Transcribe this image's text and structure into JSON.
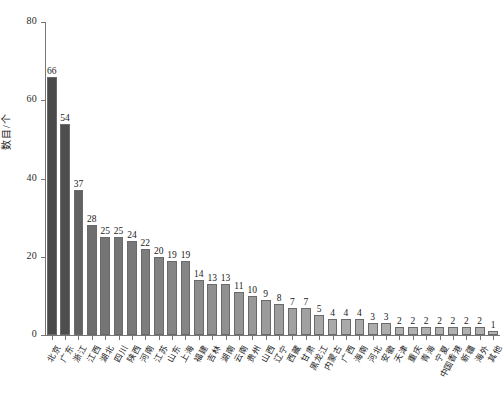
{
  "chart_data": {
    "type": "bar",
    "title": "",
    "xlabel": "",
    "ylabel": "数目/个",
    "ylim": [
      0,
      80
    ],
    "yticks": [
      0,
      20,
      40,
      60,
      80
    ],
    "grid": false,
    "legend": "none",
    "categories": [
      "北京",
      "广东",
      "浙江",
      "江西",
      "湖北",
      "四川",
      "陕西",
      "河南",
      "江苏",
      "山东",
      "上海",
      "福建",
      "吉林",
      "湖南",
      "云南",
      "贵州",
      "山西",
      "辽宁",
      "西藏",
      "甘肃",
      "黑龙江",
      "内蒙古",
      "广西",
      "海南",
      "河北",
      "安徽",
      "天津",
      "重庆",
      "青海",
      "宁夏",
      "中国香港",
      "新疆",
      "海外",
      "其他"
    ],
    "values": [
      66,
      54,
      37,
      28,
      25,
      25,
      24,
      22,
      20,
      19,
      19,
      14,
      13,
      13,
      11,
      10,
      9,
      8,
      7,
      7,
      5,
      4,
      4,
      4,
      3,
      3,
      2,
      2,
      2,
      2,
      2,
      2,
      2,
      1
    ],
    "bar_colors": [
      "#4a4a4a",
      "#4e4e4e",
      "#626262",
      "#6e6e6e",
      "#757575",
      "#757575",
      "#787878",
      "#7d7d7d",
      "#828282",
      "#858585",
      "#858585",
      "#8d8d8d",
      "#909090",
      "#909090",
      "#959595",
      "#989898",
      "#9b9b9b",
      "#9e9e9e",
      "#a1a1a1",
      "#a1a1a1",
      "#a7a7a7",
      "#aaaaaa",
      "#aaaaaa",
      "#aaaaaa",
      "#adadad",
      "#adadad",
      "#b0b0b0",
      "#b0b0b0",
      "#b0b0b0",
      "#b0b0b0",
      "#b0b0b0",
      "#b0b0b0",
      "#b0b0b0",
      "#b3b3b3"
    ],
    "bar_edge_color": "#6a6a6a",
    "axis_color": "#767676"
  }
}
